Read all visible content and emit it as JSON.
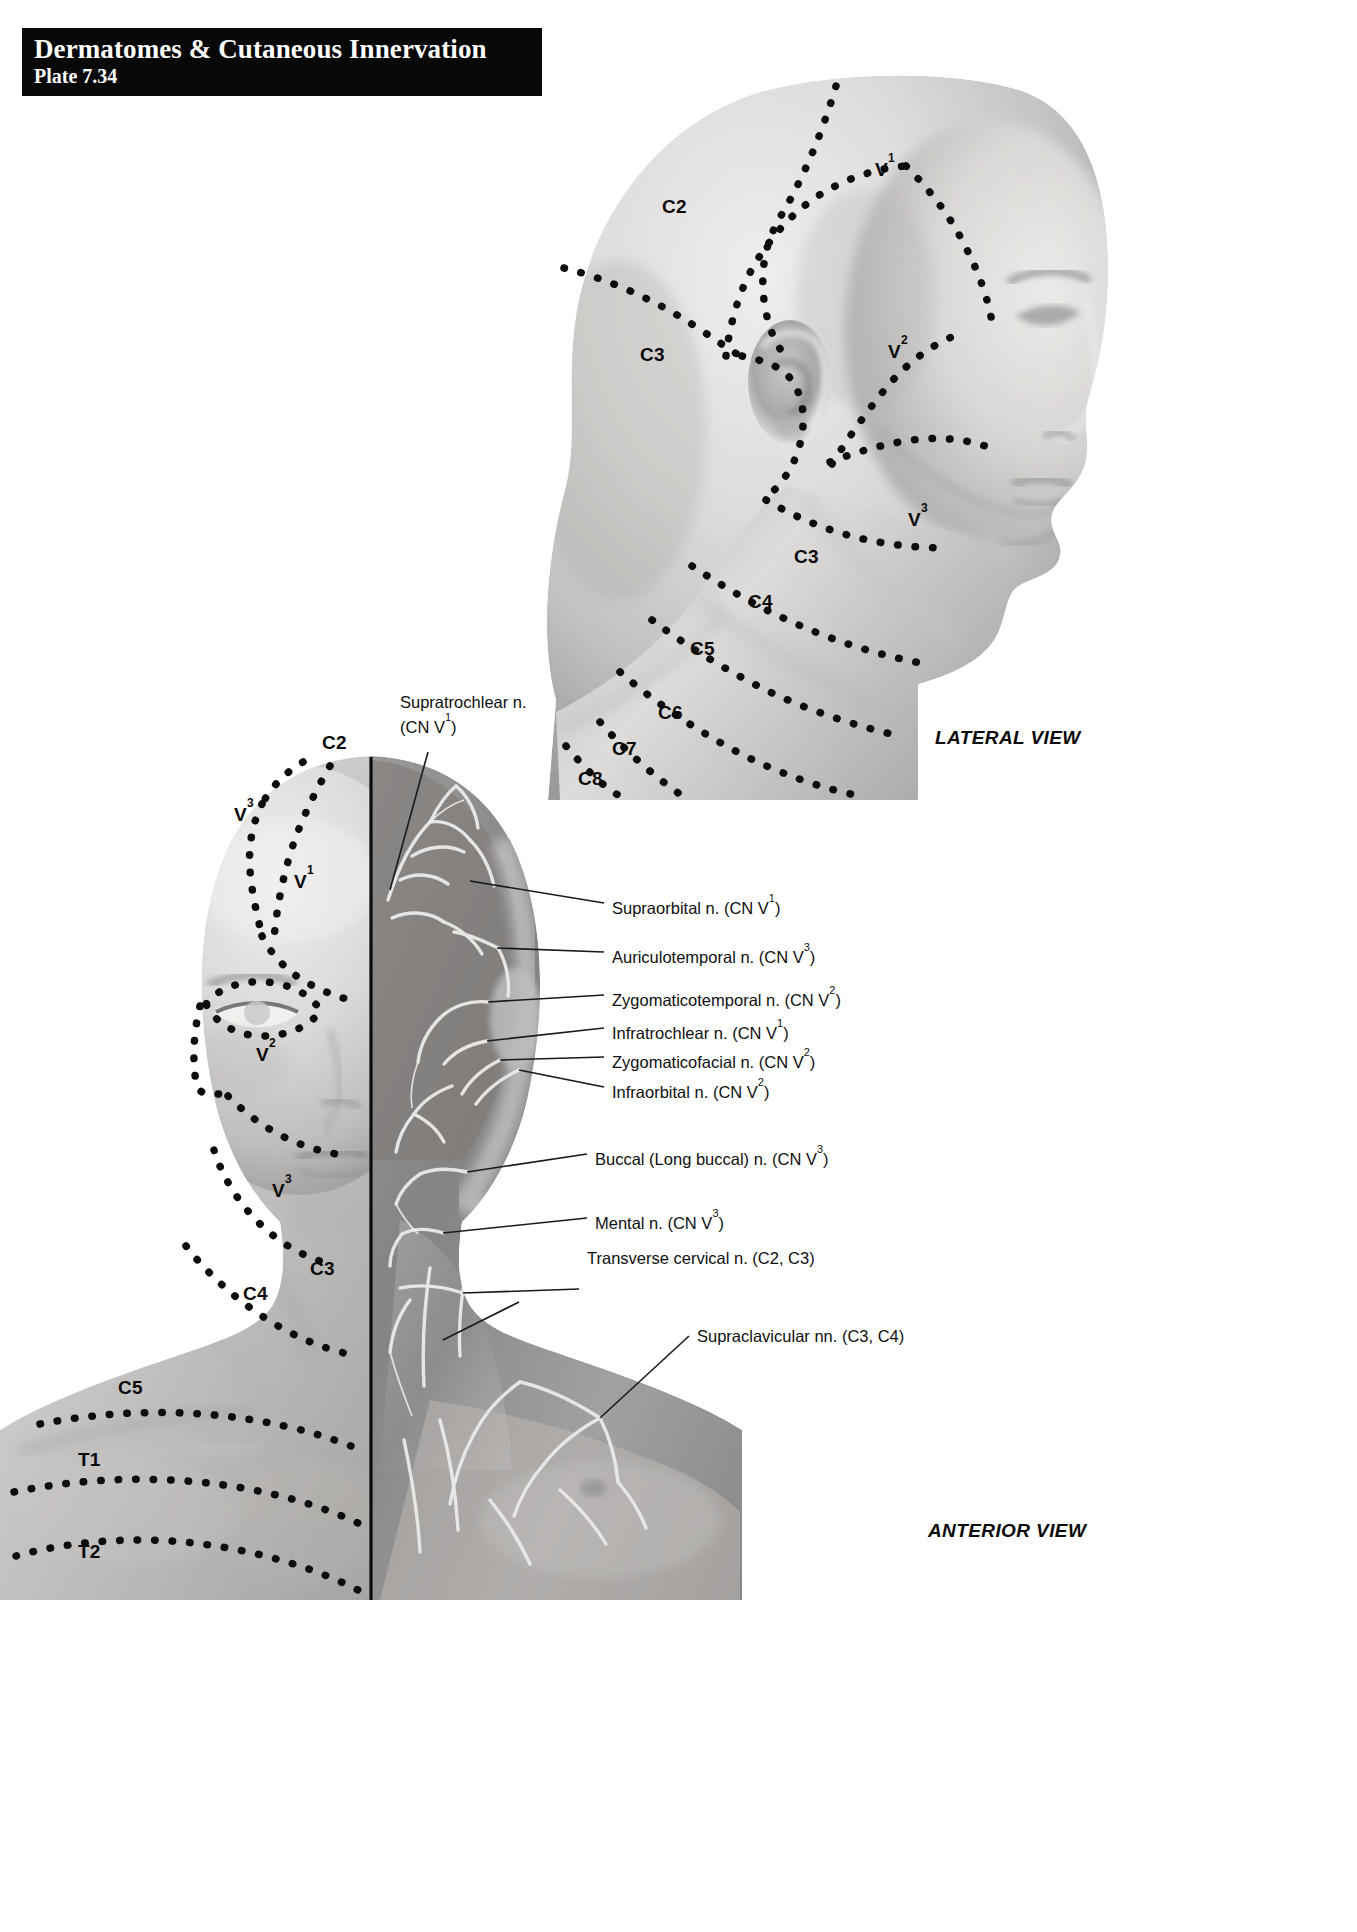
{
  "header": {
    "title": "Dermatomes & Cutaneous Innervation",
    "plate": "Plate 7.34"
  },
  "views": {
    "lateral_caption": "LATERAL VIEW",
    "anterior_caption": "ANTERIOR VIEW"
  },
  "lateral_dermatomes": [
    {
      "id": "c2",
      "base": "C2",
      "sup": "",
      "x": 662,
      "y": 196
    },
    {
      "id": "c3",
      "base": "C3",
      "sup": "",
      "x": 640,
      "y": 344
    },
    {
      "id": "v1",
      "base": "V",
      "sup": "1",
      "x": 875,
      "y": 158
    },
    {
      "id": "v2",
      "base": "V",
      "sup": "2",
      "x": 888,
      "y": 340
    },
    {
      "id": "v3",
      "base": "V",
      "sup": "3",
      "x": 908,
      "y": 508
    },
    {
      "id": "c3b",
      "base": "C3",
      "sup": "",
      "x": 794,
      "y": 546
    },
    {
      "id": "c4",
      "base": "C4",
      "sup": "",
      "x": 748,
      "y": 591
    },
    {
      "id": "c5",
      "base": "C5",
      "sup": "",
      "x": 690,
      "y": 638
    },
    {
      "id": "c6",
      "base": "C6",
      "sup": "",
      "x": 658,
      "y": 702
    },
    {
      "id": "c7",
      "base": "C7",
      "sup": "",
      "x": 612,
      "y": 738
    },
    {
      "id": "c8",
      "base": "C8",
      "sup": "",
      "x": 578,
      "y": 768
    }
  ],
  "anterior_dermatomes": [
    {
      "id": "a-c2",
      "base": "C2",
      "sup": "",
      "x": 322,
      "y": 732
    },
    {
      "id": "a-v3t",
      "base": "V",
      "sup": "3",
      "x": 234,
      "y": 803
    },
    {
      "id": "a-v1",
      "base": "V",
      "sup": "1",
      "x": 294,
      "y": 870
    },
    {
      "id": "a-v2",
      "base": "V",
      "sup": "2",
      "x": 256,
      "y": 1043
    },
    {
      "id": "a-v3",
      "base": "V",
      "sup": "3",
      "x": 272,
      "y": 1179
    },
    {
      "id": "a-c3",
      "base": "C3",
      "sup": "",
      "x": 310,
      "y": 1258
    },
    {
      "id": "a-c4",
      "base": "C4",
      "sup": "",
      "x": 243,
      "y": 1283
    },
    {
      "id": "a-c5",
      "base": "C5",
      "sup": "",
      "x": 118,
      "y": 1377
    },
    {
      "id": "a-t1",
      "base": "T1",
      "sup": "",
      "x": 78,
      "y": 1449
    },
    {
      "id": "a-t2",
      "base": "T2",
      "sup": "",
      "x": 78,
      "y": 1541
    }
  ],
  "callouts": [
    {
      "id": "supratrochlear",
      "line1": "Supratrochlear n.",
      "line2_pre": "(CN V",
      "line2_sup": "1",
      "line2_post": ")",
      "x": 400,
      "y": 692,
      "align": "left",
      "leader": "M 428,748 L 390,886"
    },
    {
      "id": "supraorbital",
      "text_pre": "Supraorbital n. (CN V",
      "text_sup": "1",
      "text_post": ")",
      "x": 612,
      "y": 893,
      "align": "left",
      "leader": "M 604,903 L 470,881"
    },
    {
      "id": "auriculotemporal",
      "text_pre": "Auriculotemporal n. (CN V",
      "text_sup": "3",
      "text_post": ")",
      "x": 612,
      "y": 942,
      "align": "left",
      "leader": "M 604,952 L 497,948"
    },
    {
      "id": "zygomaticotemporal",
      "text_pre": "Zygomaticotemporal n. (CN V",
      "text_sup": "2",
      "text_post": ")",
      "x": 612,
      "y": 985,
      "align": "left",
      "leader": "M 604,995 L 488,1002"
    },
    {
      "id": "infratrochlear",
      "text_pre": "Infratrochlear n. (CN V",
      "text_sup": "1",
      "text_post": ")",
      "x": 612,
      "y": 1018,
      "align": "left",
      "leader": "M 604,1028 L 487,1041"
    },
    {
      "id": "zygomaticofacial",
      "text_pre": "Zygomaticofacial n. (CN V",
      "text_sup": "2",
      "text_post": ")",
      "x": 612,
      "y": 1047,
      "align": "left",
      "leader": "M 604,1057 L 500,1060"
    },
    {
      "id": "infraorbital",
      "text_pre": "Infraorbital n. (CN V",
      "text_sup": "2",
      "text_post": ")",
      "x": 612,
      "y": 1077,
      "align": "left",
      "leader": "M 604,1087 L 519,1070"
    },
    {
      "id": "buccal",
      "text_pre": "Buccal (Long buccal) n. (CN V",
      "text_sup": "3",
      "text_post": ")",
      "x": 595,
      "y": 1144,
      "align": "left",
      "leader": "M 587,1154 L 467,1172"
    },
    {
      "id": "mental",
      "text_pre": "Mental n. (CN V",
      "text_sup": "3",
      "text_post": ")",
      "x": 595,
      "y": 1208,
      "align": "left",
      "leader": "M 587,1218 L 443,1233"
    },
    {
      "id": "transverse-cervical",
      "text_pre": "Transverse cervical n. (C2, C3)",
      "text_sup": "",
      "text_post": "",
      "x": 587,
      "y": 1248,
      "align": "left",
      "leader": "M 579,1289 L 463,1293"
    },
    {
      "id": "supraclavicular",
      "text_pre": "Supraclavicular nn. (C3, C4)",
      "text_sup": "",
      "text_post": "",
      "x": 697,
      "y": 1326,
      "align": "left",
      "leader": "M 689,1336 L 600,1418"
    }
  ],
  "colors": {
    "banner_bg": "#080808",
    "banner_text": "#ffffff",
    "label_text": "#0a0a0a",
    "leader_line": "#1a1a1a",
    "skin_light": "#e4e2e0",
    "skin_mid": "#c2c0be",
    "skin_dark": "#8d8b89",
    "dissection_dark": "#6e6c6a",
    "nerve_pale": "#efeeec"
  }
}
